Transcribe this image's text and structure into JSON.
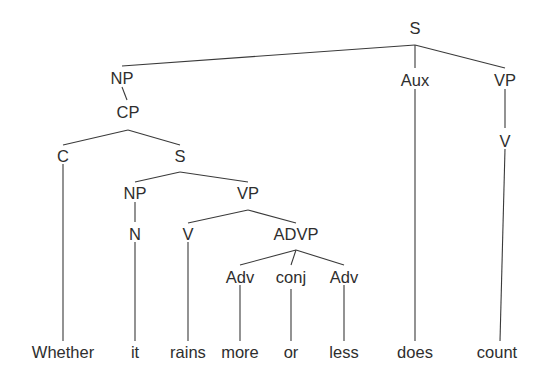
{
  "figure": {
    "name": "syntax-tree",
    "type": "constituency-tree",
    "sentence": "Whether it rains more or less does count",
    "width": 546,
    "height": 389,
    "colors": {
      "background": "#ffffff",
      "edge": "#3a3a3a",
      "text": "#2e2e2e"
    }
  },
  "nodes": [
    {
      "id": "S0",
      "label": "S",
      "x": 415,
      "y": 28,
      "kind": "phrase"
    },
    {
      "id": "NP1",
      "label": "NP",
      "x": 122,
      "y": 78,
      "kind": "phrase"
    },
    {
      "id": "CP",
      "label": "CP",
      "x": 128,
      "y": 112,
      "kind": "phrase"
    },
    {
      "id": "C",
      "label": "C",
      "x": 63,
      "y": 156,
      "kind": "head"
    },
    {
      "id": "S1",
      "label": "S",
      "x": 180,
      "y": 156,
      "kind": "phrase"
    },
    {
      "id": "NP2",
      "label": "NP",
      "x": 135,
      "y": 193,
      "kind": "phrase"
    },
    {
      "id": "VP1",
      "label": "VP",
      "x": 248,
      "y": 193,
      "kind": "phrase"
    },
    {
      "id": "N",
      "label": "N",
      "x": 135,
      "y": 234,
      "kind": "head"
    },
    {
      "id": "V1",
      "label": "V",
      "x": 188,
      "y": 234,
      "kind": "head"
    },
    {
      "id": "ADVP",
      "label": "ADVP",
      "x": 296,
      "y": 234,
      "kind": "phrase"
    },
    {
      "id": "Adv1",
      "label": "Adv",
      "x": 240,
      "y": 277,
      "kind": "head"
    },
    {
      "id": "conj",
      "label": "conj",
      "x": 291,
      "y": 277,
      "kind": "head"
    },
    {
      "id": "Adv2",
      "label": "Adv",
      "x": 344,
      "y": 277,
      "kind": "head"
    },
    {
      "id": "Aux",
      "label": "Aux",
      "x": 415,
      "y": 80,
      "kind": "head"
    },
    {
      "id": "VP2",
      "label": "VP",
      "x": 505,
      "y": 80,
      "kind": "phrase"
    },
    {
      "id": "V2",
      "label": "V",
      "x": 505,
      "y": 141,
      "kind": "head"
    }
  ],
  "leaves": [
    {
      "id": "w1",
      "label": "Whether",
      "x": 63,
      "y": 358,
      "parent": "C"
    },
    {
      "id": "w2",
      "label": "it",
      "x": 135,
      "y": 358,
      "parent": "N"
    },
    {
      "id": "w3",
      "label": "rains",
      "x": 188,
      "y": 358,
      "parent": "V1"
    },
    {
      "id": "w4",
      "label": "more",
      "x": 240,
      "y": 358,
      "parent": "Adv1"
    },
    {
      "id": "w5",
      "label": "or",
      "x": 291,
      "y": 358,
      "parent": "conj"
    },
    {
      "id": "w6",
      "label": "less",
      "x": 344,
      "y": 358,
      "parent": "Adv2"
    },
    {
      "id": "w7",
      "label": "does",
      "x": 415,
      "y": 358,
      "parent": "Aux"
    },
    {
      "id": "w8",
      "label": "count",
      "x": 497,
      "y": 358,
      "parent": "V2"
    }
  ],
  "edges": [
    {
      "from": "S0",
      "to": "NP1",
      "x1": 415,
      "y1": 45,
      "x2": 122,
      "y2": 66
    },
    {
      "from": "S0",
      "to": "Aux",
      "x1": 415,
      "y1": 45,
      "x2": 415,
      "y2": 68
    },
    {
      "from": "S0",
      "to": "VP2",
      "x1": 415,
      "y1": 45,
      "x2": 505,
      "y2": 68
    },
    {
      "from": "NP1",
      "to": "CP",
      "x1": 122,
      "y1": 87,
      "x2": 127,
      "y2": 100
    },
    {
      "from": "CP",
      "to": "C",
      "x1": 128,
      "y1": 130,
      "x2": 63,
      "y2": 145
    },
    {
      "from": "CP",
      "to": "S1",
      "x1": 128,
      "y1": 130,
      "x2": 180,
      "y2": 145
    },
    {
      "from": "S1",
      "to": "NP2",
      "x1": 180,
      "y1": 172,
      "x2": 135,
      "y2": 182
    },
    {
      "from": "S1",
      "to": "VP1",
      "x1": 180,
      "y1": 172,
      "x2": 248,
      "y2": 182
    },
    {
      "from": "NP2",
      "to": "N",
      "x1": 135,
      "y1": 202,
      "x2": 135,
      "y2": 222
    },
    {
      "from": "VP1",
      "to": "V1",
      "x1": 248,
      "y1": 210,
      "x2": 188,
      "y2": 223
    },
    {
      "from": "VP1",
      "to": "ADVP",
      "x1": 248,
      "y1": 210,
      "x2": 296,
      "y2": 223
    },
    {
      "from": "ADVP",
      "to": "Adv1",
      "x1": 296,
      "y1": 250,
      "x2": 240,
      "y2": 265
    },
    {
      "from": "ADVP",
      "to": "conj",
      "x1": 296,
      "y1": 250,
      "x2": 291,
      "y2": 265
    },
    {
      "from": "ADVP",
      "to": "Adv2",
      "x1": 296,
      "y1": 250,
      "x2": 344,
      "y2": 265
    },
    {
      "from": "VP2",
      "to": "V2",
      "x1": 505,
      "y1": 89,
      "x2": 505,
      "y2": 128
    },
    {
      "from": "C",
      "to": "w1",
      "x1": 63,
      "y1": 164,
      "x2": 63,
      "y2": 341
    },
    {
      "from": "N",
      "to": "w2",
      "x1": 135,
      "y1": 242,
      "x2": 135,
      "y2": 341
    },
    {
      "from": "V1",
      "to": "w3",
      "x1": 188,
      "y1": 242,
      "x2": 188,
      "y2": 341
    },
    {
      "from": "Adv1",
      "to": "w4",
      "x1": 240,
      "y1": 285,
      "x2": 240,
      "y2": 341
    },
    {
      "from": "conj",
      "to": "w5",
      "x1": 291,
      "y1": 289,
      "x2": 291,
      "y2": 341
    },
    {
      "from": "Adv2",
      "to": "w6",
      "x1": 344,
      "y1": 285,
      "x2": 344,
      "y2": 341
    },
    {
      "from": "Aux",
      "to": "w7",
      "x1": 415,
      "y1": 89,
      "x2": 415,
      "y2": 341
    },
    {
      "from": "V2",
      "to": "w8",
      "x1": 505,
      "y1": 149,
      "x2": 500,
      "y2": 341
    }
  ]
}
